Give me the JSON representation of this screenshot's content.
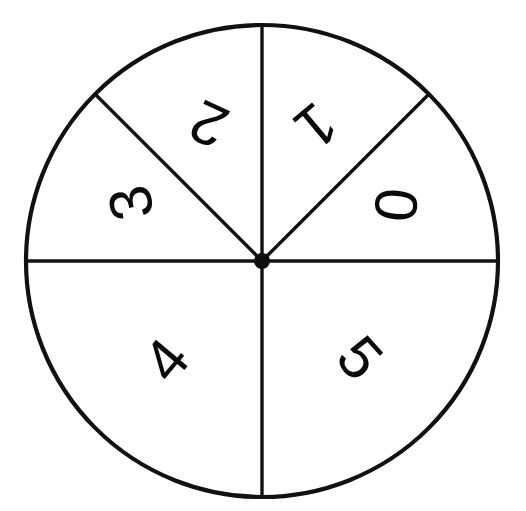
{
  "figure": {
    "kind": "spinner-wheel",
    "background_color": "#ffffff",
    "stroke_color": "#111111",
    "label_color": "#0a0a0a",
    "width": 526,
    "height": 511
  },
  "wheel": {
    "center_x": 262,
    "center_y": 261,
    "radius": 236,
    "hub_radius": 8,
    "outline_stroke_width": 4.2,
    "divider_stroke_width": 3.4,
    "sector_count": 6
  },
  "chart_data": {
    "type": "pie",
    "title": "",
    "subtitle": "",
    "xlabel": "",
    "ylabel": "",
    "legend": "none",
    "grid": false,
    "categories": [
      "0",
      "1",
      "2",
      "3",
      "4",
      "5"
    ],
    "values": [
      45,
      45,
      45,
      90,
      90,
      90
    ],
    "units": "degrees",
    "note": "Spinner wheel divided into 6 sectors labelled 0-5; three 45-degree sectors in the upper half (0, 1, 2) plus a 45-degree sector 3, and two 90-degree sectors in the lower half (4, 5)."
  },
  "sectors": [
    {
      "id": "sector-0",
      "label": "0",
      "start_angle": 0,
      "end_angle": 45,
      "label_x": 396,
      "label_y": 205,
      "label_rotation": 95,
      "label_font_size": 62
    },
    {
      "id": "sector-1",
      "label": "1",
      "start_angle": 45,
      "end_angle": 90,
      "label_x": 316,
      "label_y": 126,
      "label_rotation": 140,
      "label_font_size": 62
    },
    {
      "id": "sector-2",
      "label": "2",
      "start_angle": 90,
      "end_angle": 135,
      "label_x": 209,
      "label_y": 124,
      "label_rotation": 205,
      "label_font_size": 62
    },
    {
      "id": "sector-3",
      "label": "3",
      "start_angle": 135,
      "end_angle": 180,
      "label_x": 131,
      "label_y": 203,
      "label_rotation": 258,
      "label_font_size": 62
    },
    {
      "id": "sector-4",
      "label": "4",
      "start_angle": 180,
      "end_angle": 270,
      "label_x": 166,
      "label_y": 360,
      "label_rotation": 310,
      "label_font_size": 62
    },
    {
      "id": "sector-5",
      "label": "5",
      "start_angle": 270,
      "end_angle": 360,
      "label_x": 360,
      "label_y": 358,
      "label_rotation": 48,
      "label_font_size": 62
    }
  ],
  "dividers": [
    {
      "id": "divider-horizontal-left",
      "x1": 262,
      "y1": 261,
      "x2": 26,
      "y2": 261
    },
    {
      "id": "divider-horizontal-right",
      "x1": 262,
      "y1": 261,
      "x2": 498,
      "y2": 261
    },
    {
      "id": "divider-vertical-top",
      "x1": 262,
      "y1": 261,
      "x2": 262,
      "y2": 25
    },
    {
      "id": "divider-vertical-bottom",
      "x1": 262,
      "y1": 261,
      "x2": 262,
      "y2": 497
    },
    {
      "id": "divider-diagonal-upper-left",
      "x1": 262,
      "y1": 261,
      "x2": 95,
      "y2": 94
    },
    {
      "id": "divider-diagonal-upper-right",
      "x1": 262,
      "y1": 261,
      "x2": 429,
      "y2": 94
    }
  ]
}
